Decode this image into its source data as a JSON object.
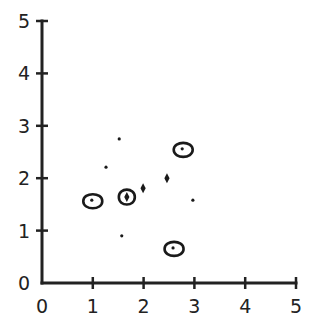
{
  "chart_data": {
    "type": "scatter",
    "title": "",
    "xlabel": "",
    "ylabel": "",
    "xlim": [
      0,
      5
    ],
    "ylim": [
      0,
      5
    ],
    "grid": false,
    "legend": null,
    "x_ticks": [
      "0",
      "1",
      "2",
      "3",
      "4",
      "5"
    ],
    "y_ticks": [
      "0",
      "1",
      "2",
      "3",
      "4",
      "5"
    ],
    "series": [
      {
        "name": "dots",
        "marker": "dot",
        "points": [
          {
            "x": 1.52,
            "y": 2.75
          },
          {
            "x": 1.26,
            "y": 2.21
          },
          {
            "x": 2.97,
            "y": 1.58
          },
          {
            "x": 1.57,
            "y": 0.9
          }
        ]
      },
      {
        "name": "circled dots",
        "marker": "loop-dot",
        "points": [
          {
            "x": 0.98,
            "y": 1.58
          },
          {
            "x": 2.76,
            "y": 2.56
          },
          {
            "x": 2.58,
            "y": 0.67
          }
        ]
      },
      {
        "name": "diamonds",
        "marker": "diamond",
        "points": [
          {
            "x": 1.99,
            "y": 1.81
          },
          {
            "x": 2.46,
            "y": 2.0
          }
        ]
      },
      {
        "name": "circled diamond",
        "marker": "loop-diamond",
        "points": [
          {
            "x": 1.67,
            "y": 1.64
          }
        ]
      }
    ]
  },
  "colors": {
    "axis": "#222222",
    "marker": "#1a1a1a",
    "background": "#ffffff"
  }
}
